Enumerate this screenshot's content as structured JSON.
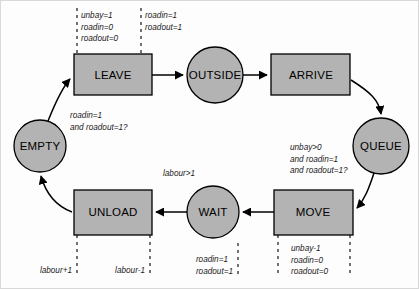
{
  "diagram": {
    "type": "state-transition",
    "fill_color": "#b3b3b3",
    "stroke_color": "#000000",
    "background_color": "#fdfdfd",
    "nodes": [
      {
        "id": "leave",
        "label": "LEAVE",
        "shape": "rect",
        "cx": 113,
        "cy": 74.5,
        "w": 78,
        "h": 41
      },
      {
        "id": "outside",
        "label": "OUTSIDE",
        "shape": "circle",
        "cx": 215,
        "cy": 75,
        "r": 28
      },
      {
        "id": "arrive",
        "label": "ARRIVE",
        "shape": "rect",
        "cx": 311,
        "cy": 74.5,
        "w": 79,
        "h": 41
      },
      {
        "id": "queue",
        "label": "QUEUE",
        "shape": "circle",
        "cx": 381,
        "cy": 146,
        "r": 28
      },
      {
        "id": "move",
        "label": "MOVE",
        "shape": "rect",
        "cx": 313,
        "cy": 212,
        "w": 79,
        "h": 45
      },
      {
        "id": "wait",
        "label": "WAIT",
        "shape": "circle",
        "cx": 213,
        "cy": 212,
        "r": 26
      },
      {
        "id": "unload",
        "label": "UNLOAD",
        "shape": "rect",
        "cx": 113,
        "cy": 212,
        "w": 78,
        "h": 45
      },
      {
        "id": "empty",
        "label": "EMPTY",
        "shape": "circle",
        "cx": 40,
        "cy": 146,
        "r": 26
      }
    ],
    "guards": [
      {
        "id": "empty-to-leave",
        "x": 70,
        "y": 110,
        "align": "left",
        "lines": [
          "roadin=1",
          "and roadout=1?"
        ]
      },
      {
        "id": "queue-to-move",
        "x": 290,
        "y": 142,
        "align": "left",
        "lines": [
          "unbay>0",
          "and roadin=1",
          "and roadout=1?"
        ]
      },
      {
        "id": "wait-to-unload",
        "x": 163,
        "y": 168,
        "align": "left",
        "lines": [
          "labour>1"
        ]
      }
    ],
    "actions": [
      {
        "id": "leave-entry",
        "x": 80,
        "y": 10,
        "align": "left",
        "lines": [
          "unbay=1",
          "roadin=0",
          "roadout=0"
        ]
      },
      {
        "id": "leave-exit",
        "x": 143,
        "y": 10,
        "align": "left",
        "lines": [
          "roadin=1",
          "roadout=1"
        ]
      },
      {
        "id": "unload-entry",
        "x": 68,
        "y": 265,
        "align": "left",
        "lines": [
          "labour+1"
        ]
      },
      {
        "id": "unload-exit",
        "x": 113,
        "y": 265,
        "align": "left",
        "lines": [
          "labour-1"
        ]
      },
      {
        "id": "wait-exit",
        "x": 233,
        "y": 254,
        "align": "right",
        "lines": [
          "roadin=1",
          "roadout=1"
        ]
      },
      {
        "id": "move-actions",
        "x": 290,
        "y": 243,
        "align": "left",
        "lines": [
          "unbay-1",
          "roadin=0",
          "roadout=0"
        ]
      }
    ],
    "dashed_guides": [
      {
        "id": "leave-left-guide",
        "x": 77,
        "y1": 8,
        "y2": 54
      },
      {
        "id": "leave-right-guide",
        "x": 141,
        "y1": 8,
        "y2": 54
      },
      {
        "id": "unload-left-guide",
        "x": 77,
        "y1": 235,
        "y2": 277
      },
      {
        "id": "unload-right-guide",
        "x": 150,
        "y1": 235,
        "y2": 277
      },
      {
        "id": "move-left-guide",
        "x": 278,
        "y1": 235,
        "y2": 277
      },
      {
        "id": "move-right-guide",
        "x": 350,
        "y1": 235,
        "y2": 277
      },
      {
        "id": "wait-exit-guide",
        "x": 238,
        "y1": 243,
        "y2": 277
      }
    ],
    "edges": [
      {
        "id": "empty-to-leave-edge",
        "from": "empty",
        "to": "leave"
      },
      {
        "id": "leave-to-outside-edge",
        "from": "leave",
        "to": "outside"
      },
      {
        "id": "outside-to-arrive-edge",
        "from": "outside",
        "to": "arrive"
      },
      {
        "id": "arrive-to-queue-edge",
        "from": "arrive",
        "to": "queue"
      },
      {
        "id": "queue-to-move-edge",
        "from": "queue",
        "to": "move"
      },
      {
        "id": "move-to-wait-edge",
        "from": "move",
        "to": "wait"
      },
      {
        "id": "wait-to-unload-edge",
        "from": "wait",
        "to": "unload"
      },
      {
        "id": "unload-to-empty-edge",
        "from": "unload",
        "to": "empty"
      }
    ]
  }
}
